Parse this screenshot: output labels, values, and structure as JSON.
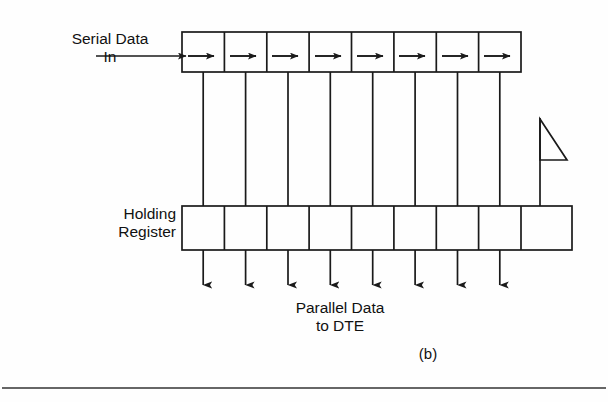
{
  "figure": {
    "caption": "(b)",
    "type": "serial-to-parallel-shift-register-diagram",
    "labels": {
      "serial_input_line1": "Serial Data",
      "serial_input_line2": "In",
      "holding_register_line1": "Holding",
      "holding_register_line2": "Register",
      "parallel_output_line1": "Parallel Data",
      "parallel_output_line2": "to DTE"
    },
    "shift_register": {
      "cell_count": 8,
      "cell_arrow_direction": "right",
      "x_start": 182,
      "x_end": 521,
      "y_top": 32,
      "y_bottom": 72
    },
    "holding_register": {
      "cell_count": 9,
      "x_start": 182,
      "x_end": 572,
      "y_top": 206,
      "y_bottom": 250
    },
    "connector_lines": 8,
    "output_arrows": 8,
    "clock_flag": {
      "present": true,
      "shape": "right-triangle-on-pole",
      "pole_x": 540,
      "pole_top": 118,
      "pole_bottom": 206
    },
    "input_arrow": {
      "x_start": 96,
      "x_end": 182,
      "y": 56
    },
    "rule": {
      "y": 388,
      "x_start": 2,
      "x_end": 606
    },
    "colors": {
      "stroke": "#1a1a1a",
      "text": "#111111",
      "background": "#fefefe",
      "rule": "#333333"
    }
  }
}
